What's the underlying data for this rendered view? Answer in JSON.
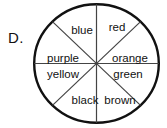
{
  "question_choice": {
    "letter": "D."
  },
  "spinner": {
    "name": "eight-sector-color-spinner",
    "outline_color": "#111111",
    "divider_color": "#444444",
    "fill_color": "#ffffff",
    "center_x": 96.5,
    "center_y": 63.5,
    "radius_x": 63.5,
    "radius_y": 60.5,
    "sector_count": 8,
    "sectors": [
      {
        "index": 0,
        "label": "red",
        "start_deg": -90,
        "end_deg": -45,
        "label_x": 117,
        "label_y": 31
      },
      {
        "index": 1,
        "label": "orange",
        "start_deg": -45,
        "end_deg": 0,
        "label_x": 130,
        "label_y": 62
      },
      {
        "index": 2,
        "label": "green",
        "start_deg": 0,
        "end_deg": 45,
        "label_x": 128,
        "label_y": 78
      },
      {
        "index": 3,
        "label": "brown",
        "start_deg": 45,
        "end_deg": 90,
        "label_x": 120,
        "label_y": 104
      },
      {
        "index": 4,
        "label": "black",
        "start_deg": 90,
        "end_deg": 135,
        "label_x": 85,
        "label_y": 104
      },
      {
        "index": 5,
        "label": "yellow",
        "start_deg": 135,
        "end_deg": 180,
        "label_x": 63,
        "label_y": 78
      },
      {
        "index": 6,
        "label": "purple",
        "start_deg": 180,
        "end_deg": 225,
        "label_x": 63,
        "label_y": 62
      },
      {
        "index": 7,
        "label": "blue",
        "start_deg": 225,
        "end_deg": 270,
        "label_x": 82,
        "label_y": 34
      }
    ]
  }
}
